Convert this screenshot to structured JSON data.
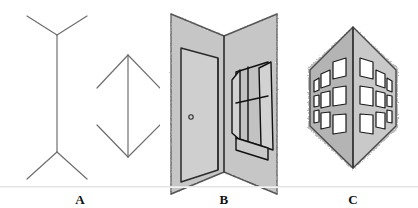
{
  "figure": {
    "kind": "muller-lyer-illusion-illustration",
    "background_color": "#ffffff",
    "baseline_y": 186,
    "baseline_color": "#e3e3e3",
    "panels": [
      {
        "id": "A",
        "caption": "A",
        "description": "Two Müller-Lyer line figures: left shaft with outward-spreading fins, right shaft with inward-pointing fins",
        "line_color": "#6e6e6e",
        "line_width": 1.2,
        "shapes": {
          "left_figure": {
            "name": "outward-fins-figure",
            "shaft": {
              "x": 57,
              "y1": 35,
              "y2": 152
            },
            "fins_top": [
              {
                "x": 27,
                "y": 16
              },
              {
                "x": 87,
                "y": 16
              }
            ],
            "fins_bottom": [
              {
                "x": 27,
                "y": 179
              },
              {
                "x": 87,
                "y": 179
              }
            ]
          },
          "right_figure": {
            "name": "inward-fins-figure",
            "shaft": {
              "x": 128,
              "y1": 55,
              "y2": 157
            },
            "fins_top": [
              {
                "x": 97,
                "y": 88
              },
              {
                "x": 160,
                "y": 88
              }
            ],
            "fins_bottom": [
              {
                "x": 97,
                "y": 125
              },
              {
                "x": 160,
                "y": 125
              }
            ]
          }
        }
      },
      {
        "id": "B",
        "caption": "B",
        "description": "Inside (concave) room corner: two walls meeting at a receding vertical edge, with a door on the left wall and an open window on the right wall",
        "wall_fill": "#c6c6c6",
        "edge_color": "#555555",
        "door_fill": "#cfcfcf",
        "door_outline": "#2b2b2b",
        "window_outline": "#111111",
        "doorknob": "doorknob"
      },
      {
        "id": "C",
        "caption": "C",
        "description": "Outside (convex) building corner: two facades meeting at a projecting vertical edge, each facade showing three rows of windows in three columns",
        "left_face_fill": "#b4b4b4",
        "right_face_fill": "#c9c9c9",
        "edge_color": "#4a4a4a",
        "window_fill": "#ffffff",
        "window_outline": "#1a1a1a",
        "window_rows": 3,
        "window_cols_per_face": 3
      }
    ]
  }
}
